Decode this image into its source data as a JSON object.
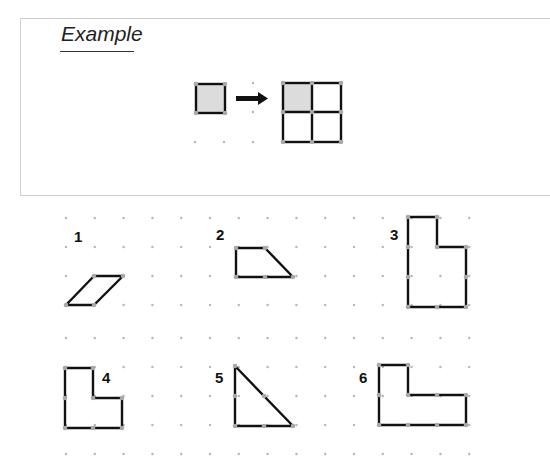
{
  "example": {
    "title": "Example",
    "description": "One shaded unit square is enlarged to a 2x2 square made of four unit squares"
  },
  "colors": {
    "edge": "#111111",
    "vertex": "#a8a8a8",
    "dot": "#b5b5b5",
    "shade": "#dcdcdc",
    "frame": "#cfcfcf"
  },
  "problems": [
    {
      "label": "1",
      "shape": "parallelogram"
    },
    {
      "label": "2",
      "shape": "trapezoid"
    },
    {
      "label": "3",
      "shape": "L-shape (tall)"
    },
    {
      "label": "4",
      "shape": "L-shape"
    },
    {
      "label": "5",
      "shape": "right triangle"
    },
    {
      "label": "6",
      "shape": "L-shape (wide)"
    }
  ]
}
